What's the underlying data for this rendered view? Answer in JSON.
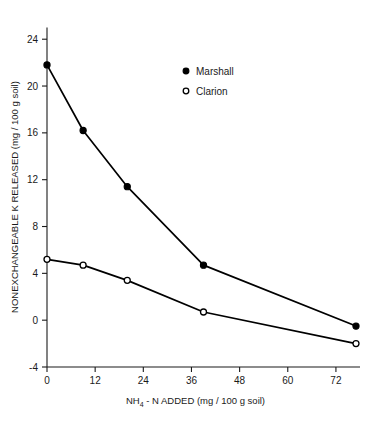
{
  "chart_data": {
    "type": "line",
    "title": "",
    "subtitle": "",
    "xlabel_parts": {
      "pre": "NH",
      "sub": "4",
      "post": " - N ADDED (mg / 100 g soil)"
    },
    "xlabel": "NH4 - N ADDED (mg / 100 g soil)",
    "ylabel": "NONEXCHANGEABLE K RELEASED (mg / 100 g soil)",
    "xlim": [
      0,
      78
    ],
    "ylim": [
      -4,
      25
    ],
    "xticks": [
      0,
      12,
      24,
      36,
      48,
      60,
      72
    ],
    "xticklabels": [
      "0",
      "12",
      "24",
      "36",
      "48",
      "60",
      "72"
    ],
    "yticks": [
      -4,
      0,
      4,
      8,
      12,
      16,
      20,
      24
    ],
    "yticklabels": [
      "-4",
      "0",
      "4",
      "8",
      "12",
      "16",
      "20",
      "24"
    ],
    "grid": false,
    "legend_position": "upper-center",
    "series": [
      {
        "name": "Marshall",
        "marker": "filled-circle",
        "color": "#000000",
        "x": [
          0,
          9,
          20,
          39,
          77
        ],
        "values": [
          21.8,
          16.2,
          11.4,
          4.7,
          -0.5
        ]
      },
      {
        "name": "Clarion",
        "marker": "open-circle",
        "color": "#000000",
        "x": [
          0,
          9,
          20,
          39,
          77
        ],
        "values": [
          5.2,
          4.7,
          3.4,
          0.7,
          -2.0
        ]
      }
    ],
    "annotations": []
  },
  "legend": {
    "entries": [
      {
        "label": "Marshall",
        "marker": "filled-circle"
      },
      {
        "label": "Clarion",
        "marker": "open-circle"
      }
    ]
  }
}
